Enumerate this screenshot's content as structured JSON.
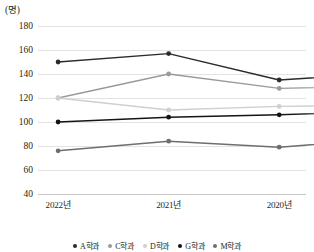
{
  "chart_data": {
    "type": "line",
    "title": "",
    "subtitle": "",
    "xlabel": "",
    "ylabel": "",
    "unit_label": "(명)",
    "categories": [
      "2022년",
      "2021년",
      "2020년",
      "2019년",
      "2018년"
    ],
    "ylim": [
      40,
      180
    ],
    "ytick_step": 20,
    "yticks": [
      "180",
      "160",
      "140",
      "120",
      "100",
      "80",
      "60",
      "40"
    ],
    "grid": true,
    "legend_position": "bottom",
    "series": [
      {
        "name": "A학과",
        "color": "#2b2b2b",
        "values": [
          150,
          157,
          135,
          141,
          105
        ]
      },
      {
        "name": "C학과",
        "color": "#9a9a9a",
        "values": [
          120,
          140,
          128,
          130,
          126
        ]
      },
      {
        "name": "D학과",
        "color": "#cfcfcf",
        "values": [
          120,
          110,
          113,
          114,
          107
        ]
      },
      {
        "name": "G학과",
        "color": "#141414",
        "values": [
          100,
          104,
          106,
          109,
          104
        ]
      },
      {
        "name": "M학과",
        "color": "#6e6e6e",
        "values": [
          76,
          84,
          79,
          86,
          88
        ]
      }
    ]
  }
}
